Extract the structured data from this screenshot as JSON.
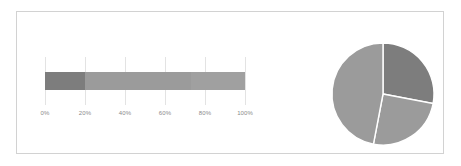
{
  "figure": {
    "background_color": "#ffffff",
    "frame_color": "#d2d2d2"
  },
  "chart_data": [
    {
      "type": "bar",
      "orientation": "horizontal",
      "stacked": true,
      "title": "",
      "xlabel": "",
      "ylabel": "",
      "xlim": [
        0,
        100
      ],
      "grid": true,
      "categories": [
        ""
      ],
      "tick_labels": [
        "0%",
        "20%",
        "40%",
        "60%",
        "80%",
        "100%"
      ],
      "tick_values": [
        0,
        20,
        40,
        60,
        80,
        100
      ],
      "series": [
        {
          "name": "Segment 1",
          "values": [
            20
          ],
          "color": "#7d7d7d"
        },
        {
          "name": "Segment 2",
          "values": [
            53
          ],
          "color": "#9b9b9b"
        },
        {
          "name": "Segment 3",
          "values": [
            27
          ],
          "color": "#a0a0a0"
        }
      ]
    },
    {
      "type": "pie",
      "title": "",
      "labels": [
        "Slice 1",
        "Slice 2",
        "Slice 3"
      ],
      "values": [
        28,
        25,
        47
      ],
      "start_angle": 0,
      "colors": [
        "#7d7d7d",
        "#9b9b9b",
        "#9b9b9b"
      ],
      "wedge_edge_color": "#ffffff",
      "legend": "none"
    }
  ]
}
